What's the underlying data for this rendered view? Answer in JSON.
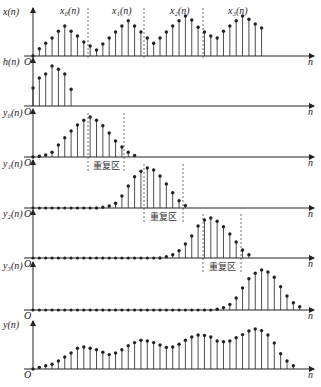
{
  "figure": {
    "origin_label": "O",
    "n_label": "n",
    "overlap_label": "重复区",
    "colors": {
      "stroke": "#222222",
      "dash": "#333333",
      "bg": "#ffffff"
    },
    "layout": {
      "x0": 33,
      "dx": 6.35,
      "x_end": 314,
      "amp": 40
    }
  },
  "panels": [
    {
      "id": "x",
      "y_label": "x(n)",
      "base_y": 56,
      "segment_labels": [
        {
          "text": "x₀(n)",
          "x": 60
        },
        {
          "text": "x₁(n)",
          "x": 112
        },
        {
          "text": "x₂(n)",
          "x": 170
        },
        {
          "text": "x₃(n)",
          "x": 228
        }
      ],
      "dividers": [
        88,
        144,
        203
      ],
      "start": 0,
      "values": [
        0.0,
        0.18,
        0.32,
        0.45,
        0.62,
        0.75,
        0.62,
        0.5,
        0.35,
        0.25,
        0.15,
        0.3,
        0.45,
        0.6,
        0.75,
        0.88,
        0.75,
        0.6,
        0.45,
        0.32,
        0.45,
        0.6,
        0.75,
        0.88,
        1.0,
        0.9,
        0.72,
        0.6,
        0.5,
        0.45,
        0.62,
        0.75,
        0.88,
        1.0,
        0.92,
        0.8,
        0.7
      ]
    },
    {
      "id": "h",
      "y_label": "h(n)",
      "base_y": 106,
      "start": 0,
      "values": [
        0.45,
        0.7,
        0.8,
        1.0,
        0.92,
        0.8,
        0.42
      ]
    },
    {
      "id": "y0",
      "y_label": "y₀(n)",
      "base_y": 157,
      "overlap": {
        "left": 88,
        "right": 124,
        "label_x": 106
      },
      "start": 0,
      "values": [
        0.0,
        0.02,
        0.05,
        0.12,
        0.3,
        0.48,
        0.65,
        0.8,
        0.92,
        1.0,
        0.92,
        0.78,
        0.6,
        0.4,
        0.25,
        0.12,
        0.04
      ]
    },
    {
      "id": "y1",
      "y_label": "y₁(n)",
      "base_y": 208,
      "overlap": {
        "left": 144,
        "right": 183,
        "label_x": 163
      },
      "zeros_before": 10,
      "start": 10,
      "values": [
        0.0,
        0.02,
        0.05,
        0.12,
        0.3,
        0.55,
        0.78,
        0.92,
        1.0,
        0.95,
        0.8,
        0.6,
        0.38,
        0.18,
        0.06
      ]
    },
    {
      "id": "y2",
      "y_label": "y₂(n)",
      "base_y": 258,
      "overlap": {
        "left": 203,
        "right": 241,
        "label_x": 222
      },
      "zeros_before": 20,
      "start": 20,
      "values": [
        0.0,
        0.03,
        0.08,
        0.18,
        0.35,
        0.55,
        0.8,
        0.95,
        1.0,
        0.92,
        0.78,
        0.6,
        0.4,
        0.2,
        0.08
      ]
    },
    {
      "id": "y3",
      "y_label": "y₃(n)",
      "base_y": 310,
      "zeros_before": 29,
      "start": 29,
      "values": [
        0.02,
        0.06,
        0.14,
        0.3,
        0.55,
        0.78,
        0.92,
        1.0,
        0.95,
        0.82,
        0.58,
        0.35,
        0.18,
        0.08
      ]
    },
    {
      "id": "y",
      "y_label": "y(n)",
      "base_y": 369,
      "start": 0,
      "values": [
        0.0,
        0.04,
        0.08,
        0.12,
        0.2,
        0.3,
        0.4,
        0.52,
        0.55,
        0.52,
        0.48,
        0.42,
        0.36,
        0.4,
        0.48,
        0.58,
        0.66,
        0.72,
        0.7,
        0.66,
        0.6,
        0.54,
        0.55,
        0.62,
        0.72,
        0.8,
        0.85,
        0.84,
        0.8,
        0.7,
        0.68,
        0.7,
        0.78,
        0.86,
        0.95,
        1.0,
        0.96,
        0.85,
        0.65,
        0.38,
        0.2,
        0.08
      ]
    }
  ]
}
